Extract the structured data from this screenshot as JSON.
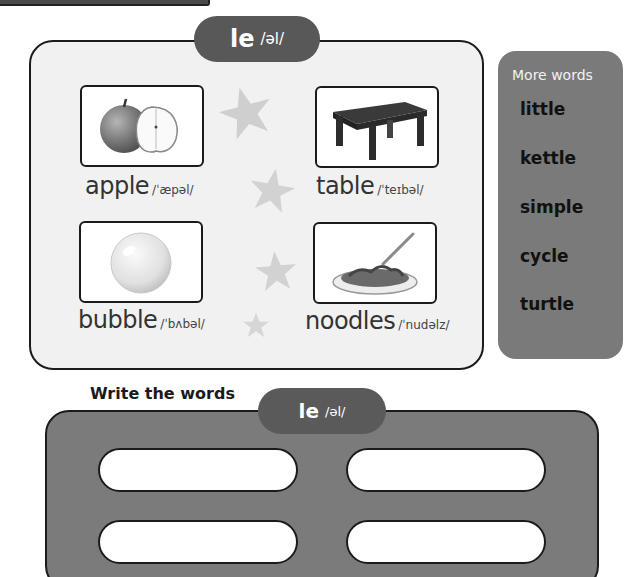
{
  "header": {
    "pattern": "le",
    "ipa": "/əl/"
  },
  "words": [
    {
      "word": "apple",
      "ipa": "/ˈæpəl/",
      "icon": "apple-icon"
    },
    {
      "word": "table",
      "ipa": "/ˈteɪbəl/",
      "icon": "table-icon"
    },
    {
      "word": "bubble",
      "ipa": "/ˈbʌbəl/",
      "icon": "bubble-icon"
    },
    {
      "word": "noodles",
      "ipa": "/ˈnudəlz/",
      "icon": "noodles-icon"
    }
  ],
  "more_words": {
    "title": "More words",
    "items": [
      "little",
      "kettle",
      "simple",
      "cycle",
      "turtle"
    ]
  },
  "write": {
    "title": "Write the words",
    "pattern": "le",
    "ipa": "/əl/",
    "blanks": [
      "",
      "",
      "",
      ""
    ]
  },
  "colors": {
    "pill": "#585858",
    "panel_light": "#f1f1f1",
    "panel_dark": "#7b7b7b",
    "border": "#1b1b1b",
    "star": "#cfcfcf"
  }
}
